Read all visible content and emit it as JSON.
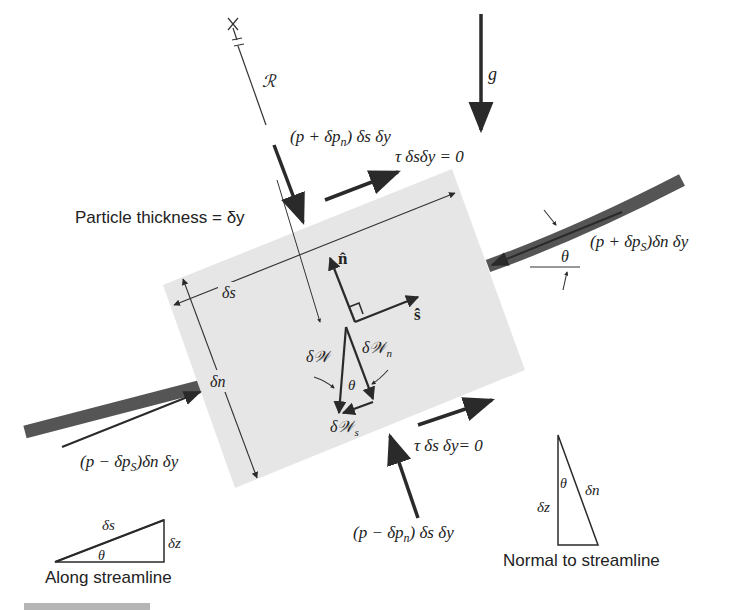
{
  "diagram": {
    "labels": {
      "particle_thickness": "Particle thickness = δy",
      "radius": "ℛ",
      "gravity": "g",
      "top_pressure": "(p + δp",
      "top_pressure_sub": "n",
      "top_pressure_tail": ") δs δy",
      "top_shear": "τ δsδy = 0",
      "right_pressure": "(p + δp",
      "right_pressure_sub": "S",
      "right_pressure_tail": ")δn δy",
      "left_pressure": "(p − δp",
      "left_pressure_sub": "S",
      "left_pressure_tail": ")δn δy",
      "bottom_pressure": "(p − δp",
      "bottom_pressure_sub": "n",
      "bottom_pressure_tail": ") δs δy",
      "bottom_shear": "τ δs δy= 0",
      "delta_s": "δs",
      "delta_n": "δn",
      "n_hat": "n̂",
      "s_hat": "ŝ",
      "weight": "δ𝒲",
      "weight_n": "δ𝒲",
      "weight_n_sub": "n",
      "weight_s": "δ𝒲",
      "weight_s_sub": "s",
      "theta": "θ",
      "theta_right": "θ"
    },
    "insets": {
      "along": {
        "caption": "Along streamline",
        "hyp": "δs",
        "side": "δz",
        "angle": "θ"
      },
      "normal": {
        "caption": "Normal to streamline",
        "hyp": "δn",
        "side": "δz",
        "angle": "θ"
      }
    },
    "colors": {
      "particle_fill": "#e6e6e6",
      "streamline": "#555555",
      "arrow": "#2a2a2a",
      "text": "#222222",
      "footer_bar": "#b5b5b5"
    }
  }
}
